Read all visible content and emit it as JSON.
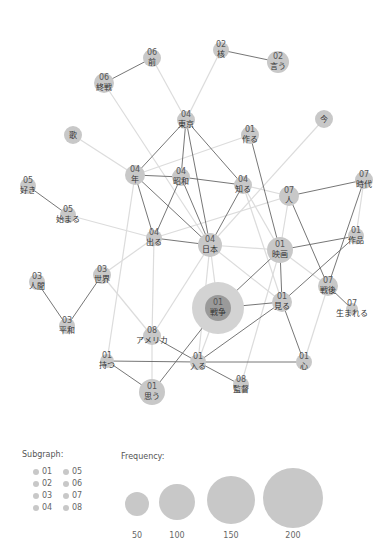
{
  "graph": {
    "nodes": [
      {
        "id": "mae",
        "subgraph": "06",
        "word": "前",
        "x": 152,
        "y": 58,
        "r": 9
      },
      {
        "id": "shusen",
        "subgraph": "06",
        "word": "終戦",
        "x": 104,
        "y": 83,
        "r": 10
      },
      {
        "id": "kaku",
        "subgraph": "02",
        "word": "核",
        "x": 221,
        "y": 50,
        "r": 8
      },
      {
        "id": "iu",
        "subgraph": "02",
        "word": "言う",
        "x": 278,
        "y": 62,
        "r": 11
      },
      {
        "id": "tokyo",
        "subgraph": "04",
        "word": "東京",
        "x": 186,
        "y": 120,
        "r": 9
      },
      {
        "id": "uta",
        "subgraph": "",
        "word": "歌",
        "x": 73,
        "y": 135,
        "r": 9
      },
      {
        "id": "tsukuru",
        "subgraph": "01",
        "word": "作る",
        "x": 250,
        "y": 135,
        "r": 9
      },
      {
        "id": "ima",
        "subgraph": "",
        "word": "今",
        "x": 324,
        "y": 119,
        "r": 9
      },
      {
        "id": "nen",
        "subgraph": "04",
        "word": "年",
        "x": 135,
        "y": 175,
        "r": 10
      },
      {
        "id": "showa",
        "subgraph": "04",
        "word": "昭和",
        "x": 181,
        "y": 177,
        "r": 9
      },
      {
        "id": "shiru",
        "subgraph": "04",
        "word": "知る",
        "x": 243,
        "y": 185,
        "r": 9
      },
      {
        "id": "suki",
        "subgraph": "05",
        "word": "好き",
        "x": 28,
        "y": 186,
        "r": 8
      },
      {
        "id": "hajimaru",
        "subgraph": "05",
        "word": "始まる",
        "x": 68,
        "y": 215,
        "r": 8
      },
      {
        "id": "hito",
        "subgraph": "07",
        "word": "人",
        "x": 289,
        "y": 196,
        "r": 10
      },
      {
        "id": "jidai",
        "subgraph": "07",
        "word": "時代",
        "x": 364,
        "y": 180,
        "r": 9
      },
      {
        "id": "deru",
        "subgraph": "04",
        "word": "出る",
        "x": 154,
        "y": 238,
        "r": 8
      },
      {
        "id": "nihon",
        "subgraph": "04",
        "word": "日本",
        "x": 210,
        "y": 245,
        "r": 12
      },
      {
        "id": "eiga",
        "subgraph": "01",
        "word": "映画",
        "x": 280,
        "y": 250,
        "r": 13
      },
      {
        "id": "sakuhin",
        "subgraph": "01",
        "word": "作品",
        "x": 356,
        "y": 236,
        "r": 8
      },
      {
        "id": "ningen",
        "subgraph": "03",
        "word": "人間",
        "x": 37,
        "y": 282,
        "r": 8
      },
      {
        "id": "sekai",
        "subgraph": "03",
        "word": "世界",
        "x": 102,
        "y": 275,
        "r": 9
      },
      {
        "id": "heiwa",
        "subgraph": "03",
        "word": "平和",
        "x": 67,
        "y": 326,
        "r": 8
      },
      {
        "id": "senso",
        "subgraph": "01",
        "word": "戦争",
        "x": 218,
        "y": 308,
        "r": 13,
        "halo": 26
      },
      {
        "id": "miru",
        "subgraph": "01",
        "word": "見る",
        "x": 282,
        "y": 302,
        "r": 10
      },
      {
        "id": "sengo",
        "subgraph": "07",
        "word": "戦後",
        "x": 328,
        "y": 286,
        "r": 10
      },
      {
        "id": "umareru",
        "subgraph": "07",
        "word": "生まれる",
        "x": 352,
        "y": 309,
        "r": 6
      },
      {
        "id": "america",
        "subgraph": "08",
        "word": "アメリカ",
        "x": 152,
        "y": 336,
        "r": 9
      },
      {
        "id": "motsu",
        "subgraph": "01",
        "word": "持つ",
        "x": 107,
        "y": 361,
        "r": 7
      },
      {
        "id": "hairu",
        "subgraph": "01",
        "word": "入る",
        "x": 198,
        "y": 362,
        "r": 8
      },
      {
        "id": "kokoro",
        "subgraph": "01",
        "word": "心",
        "x": 304,
        "y": 362,
        "r": 8
      },
      {
        "id": "omou",
        "subgraph": "01",
        "word": "思う",
        "x": 152,
        "y": 392,
        "r": 13
      },
      {
        "id": "kantoku",
        "subgraph": "08",
        "word": "監督",
        "x": 241,
        "y": 385,
        "r": 8
      }
    ],
    "edges_strong": [
      [
        "mae",
        "shusen"
      ],
      [
        "kaku",
        "iu"
      ],
      [
        "tokyo",
        "nen"
      ],
      [
        "tokyo",
        "showa"
      ],
      [
        "tokyo",
        "shiru"
      ],
      [
        "tokyo",
        "nihon"
      ],
      [
        "nen",
        "showa"
      ],
      [
        "nen",
        "deru"
      ],
      [
        "nen",
        "nihon"
      ],
      [
        "showa",
        "shiru"
      ],
      [
        "showa",
        "deru"
      ],
      [
        "showa",
        "nihon"
      ],
      [
        "shiru",
        "nihon"
      ],
      [
        "tsukuru",
        "eiga"
      ],
      [
        "suki",
        "hajimaru"
      ],
      [
        "deru",
        "nihon"
      ],
      [
        "hito",
        "jidai"
      ],
      [
        "hito",
        "sengo"
      ],
      [
        "jidai",
        "sengo"
      ],
      [
        "eiga",
        "sakuhin"
      ],
      [
        "eiga",
        "miru"
      ],
      [
        "sakuhin",
        "miru"
      ],
      [
        "sengo",
        "umareru"
      ],
      [
        "ningen",
        "heiwa"
      ],
      [
        "heiwa",
        "sekai"
      ],
      [
        "senso",
        "eiga"
      ],
      [
        "senso",
        "miru"
      ],
      [
        "miru",
        "kokoro"
      ],
      [
        "miru",
        "hairu"
      ],
      [
        "america",
        "hairu"
      ],
      [
        "motsu",
        "hairu"
      ],
      [
        "motsu",
        "omou"
      ],
      [
        "hairu",
        "kokoro"
      ],
      [
        "hairu",
        "kantoku"
      ],
      [
        "omou",
        "senso"
      ]
    ],
    "edges_weak": [
      [
        "mae",
        "tokyo"
      ],
      [
        "kaku",
        "tokyo"
      ],
      [
        "shusen",
        "nihon"
      ],
      [
        "uta",
        "nen"
      ],
      [
        "tsukuru",
        "nen"
      ],
      [
        "ima",
        "nihon"
      ],
      [
        "shiru",
        "hito"
      ],
      [
        "shiru",
        "eiga"
      ],
      [
        "shiru",
        "miru"
      ],
      [
        "hajimaru",
        "deru"
      ],
      [
        "deru",
        "sekai"
      ],
      [
        "deru",
        "america"
      ],
      [
        "nen",
        "motsu"
      ],
      [
        "nihon",
        "eiga"
      ],
      [
        "nihon",
        "senso"
      ],
      [
        "nihon",
        "america"
      ],
      [
        "nihon",
        "miru"
      ],
      [
        "hito",
        "eiga"
      ],
      [
        "hito",
        "deru"
      ],
      [
        "jidai",
        "sakuhin"
      ],
      [
        "sekai",
        "america"
      ],
      [
        "america",
        "omou"
      ],
      [
        "sengo",
        "kokoro"
      ],
      [
        "eiga",
        "kantoku"
      ],
      [
        "eiga",
        "sengo"
      ],
      [
        "senso",
        "hairu"
      ],
      [
        "nihon",
        "hairu"
      ]
    ]
  },
  "legend": {
    "subgraph_title": "Subgraph:",
    "subgraph_items": [
      "01",
      "05",
      "02",
      "06",
      "03",
      "07",
      "04",
      "08"
    ],
    "frequency_title": "Frequency:",
    "frequency_items": [
      {
        "label": "50",
        "r": 12
      },
      {
        "label": "100",
        "r": 18
      },
      {
        "label": "150",
        "r": 24
      },
      {
        "label": "200",
        "r": 30
      }
    ]
  }
}
